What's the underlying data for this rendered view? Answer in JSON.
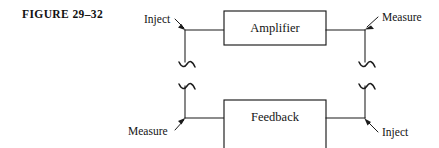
{
  "figure": {
    "caption": "FIGURE 29–32",
    "background_color": "#ffffff",
    "line_color": "#1b1b1b",
    "text_color": "#141414"
  },
  "blocks": [
    {
      "id": "amplifier",
      "label": "Amplifier"
    },
    {
      "id": "feedback",
      "label": "Feedback"
    }
  ],
  "probes": {
    "top_left": {
      "label": "Inject",
      "arrow_direction": "down-right"
    },
    "top_right": {
      "label": "Measure",
      "arrow_direction": "down-left"
    },
    "bottom_left": {
      "label": "Measure",
      "arrow_direction": "up-right"
    },
    "bottom_right": {
      "label": "Inject",
      "arrow_direction": "up-left"
    }
  },
  "symbols": {
    "wire_break": "squiggle-break",
    "wire_break_count": 4
  }
}
